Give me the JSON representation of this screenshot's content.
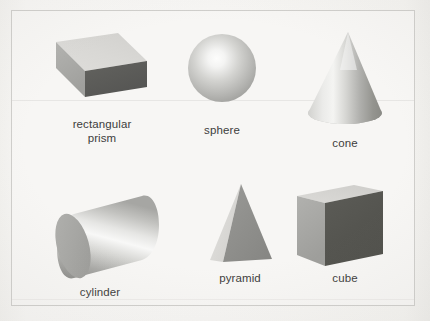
{
  "figure": {
    "kind": "educational-diagram",
    "background_color": "#f6f5f3",
    "border_color": "#cfcecb",
    "label_color": "#3d3d3c",
    "rows": 2,
    "columns": 3
  },
  "shapes": [
    {
      "id": "rectangular-prism",
      "label": "rectangular\nprism",
      "label_lines": [
        "rectangular",
        "prism"
      ],
      "row": 1,
      "column": 1,
      "faces_visible": 3,
      "colors": {
        "top": "#d8d7d4",
        "side": "#a9a9a6",
        "end": "#5c5c5a"
      }
    },
    {
      "id": "sphere",
      "label": "sphere",
      "row": 1,
      "column": 2,
      "faces_visible": 1,
      "colors": {
        "highlight": "#fbfbfa",
        "mid": "#b9b9b6",
        "shadow": "#8f8f8c"
      }
    },
    {
      "id": "cone",
      "label": "cone",
      "row": 1,
      "column": 3,
      "faces_visible": 2,
      "colors": {
        "highlight": "#f0efee",
        "mid": "#bdbdba",
        "shadow": "#8c8c89"
      }
    },
    {
      "id": "cylinder",
      "label": "cylinder",
      "row": 2,
      "column": 1,
      "faces_visible": 2,
      "colors": {
        "cap": "#a5a5a2",
        "highlight": "#fafaf9",
        "shadow": "#8d8d8a"
      }
    },
    {
      "id": "pyramid",
      "label": "pyramid",
      "row": 2,
      "column": 2,
      "faces_visible": 2,
      "colors": {
        "left": "#d6d5d2",
        "right": "#8e8e8b"
      }
    },
    {
      "id": "cube",
      "label": "cube",
      "row": 2,
      "column": 3,
      "faces_visible": 3,
      "colors": {
        "top": "#d6d5d2",
        "left": "#a8a8a5",
        "front": "#55554f"
      }
    }
  ]
}
